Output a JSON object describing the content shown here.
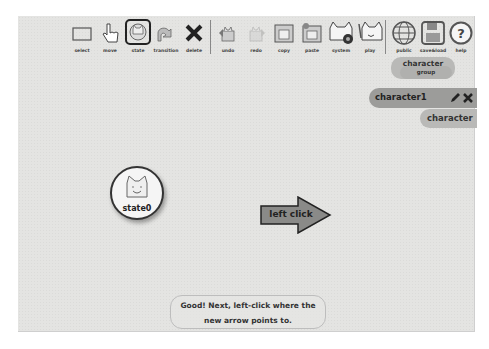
{
  "toolbar": {
    "tools": [
      {
        "id": "select",
        "label": "select",
        "icon": "select-rect-icon"
      },
      {
        "id": "move",
        "label": "move",
        "icon": "hand-pointer-icon"
      },
      {
        "id": "state",
        "label": "state",
        "icon": "cat-state-icon",
        "selected": true
      },
      {
        "id": "transition",
        "label": "transition",
        "icon": "curved-arrow-icon"
      },
      {
        "id": "delete",
        "label": "delete",
        "icon": "x-icon"
      },
      {
        "id": "undo",
        "label": "undo",
        "icon": "undo-cat-icon"
      },
      {
        "id": "redo",
        "label": "redo",
        "icon": "redo-cat-icon"
      },
      {
        "id": "copy",
        "label": "copy",
        "icon": "copy-folder-icon"
      },
      {
        "id": "paste",
        "label": "paste",
        "icon": "paste-folder-icon"
      },
      {
        "id": "system",
        "label": "system",
        "icon": "cat-gear-icon"
      },
      {
        "id": "play",
        "label": "play",
        "icon": "cat-play-icon"
      },
      {
        "id": "public",
        "label": "public",
        "icon": "globe-icon"
      },
      {
        "id": "save_load",
        "label": "save&load",
        "icon": "floppy-disk-icon"
      },
      {
        "id": "help",
        "label": "help",
        "icon": "question-circle-icon"
      }
    ]
  },
  "side_panel": {
    "group_button": {
      "line1": "character",
      "line2": "group"
    },
    "selected_character": {
      "label": "character1"
    },
    "add_character": {
      "label": "character"
    }
  },
  "canvas": {
    "state_node": {
      "label": "state0"
    },
    "arrow_hint": {
      "label": "left click"
    }
  },
  "instruction": {
    "text": "Good! Next, left-click where the new arrow points to."
  },
  "colors": {
    "canvas_bg": "#e4e4e2",
    "pill_bg": "#b9b9b7",
    "selected_pill_bg": "#9c9c9a",
    "arrow_fill": "#8a8a88"
  }
}
